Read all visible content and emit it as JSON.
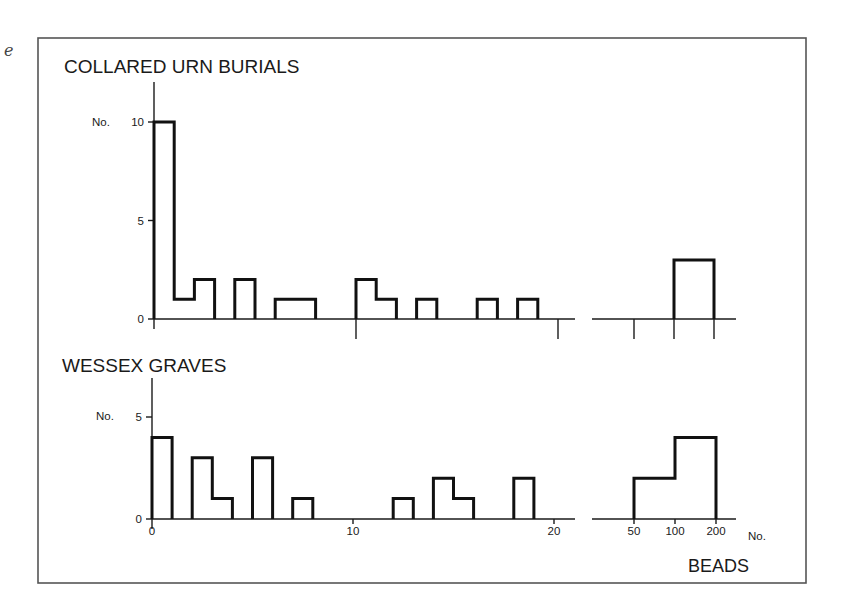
{
  "figure": {
    "margin_mark": "e",
    "beads_label": "BEADS",
    "no_label": "No."
  },
  "chart_data": [
    {
      "type": "bar",
      "title": "COLLARED URN BURIALS",
      "ylabel": "No.",
      "xlabel": "BEADS (No.)",
      "ylim": [
        0,
        10
      ],
      "yticks": [
        0,
        5,
        10
      ],
      "xticks": [
        0,
        10,
        20
      ],
      "xtick_labels_shown": false,
      "grid": false,
      "bins_unit": [
        {
          "x0": 0,
          "x1": 1,
          "count": 10
        },
        {
          "x0": 1,
          "x1": 2,
          "count": 1
        },
        {
          "x0": 2,
          "x1": 3,
          "count": 2
        },
        {
          "x0": 3,
          "x1": 4,
          "count": 0
        },
        {
          "x0": 4,
          "x1": 5,
          "count": 2
        },
        {
          "x0": 5,
          "x1": 6,
          "count": 0
        },
        {
          "x0": 6,
          "x1": 7,
          "count": 1
        },
        {
          "x0": 7,
          "x1": 8,
          "count": 1
        },
        {
          "x0": 8,
          "x1": 9,
          "count": 0
        },
        {
          "x0": 9,
          "x1": 10,
          "count": 0
        },
        {
          "x0": 10,
          "x1": 11,
          "count": 2
        },
        {
          "x0": 11,
          "x1": 12,
          "count": 1
        },
        {
          "x0": 12,
          "x1": 13,
          "count": 0
        },
        {
          "x0": 13,
          "x1": 14,
          "count": 1
        },
        {
          "x0": 14,
          "x1": 15,
          "count": 0
        },
        {
          "x0": 15,
          "x1": 16,
          "count": 0
        },
        {
          "x0": 16,
          "x1": 17,
          "count": 1
        },
        {
          "x0": 17,
          "x1": 18,
          "count": 0
        },
        {
          "x0": 18,
          "x1": 19,
          "count": 1
        }
      ],
      "bins_large": [
        {
          "range": "50-100",
          "count": 0
        },
        {
          "range": "100-200",
          "count": 3
        }
      ]
    },
    {
      "type": "bar",
      "title": "WESSEX GRAVES",
      "ylabel": "No.",
      "xlabel": "BEADS (No.)",
      "ylim": [
        0,
        5
      ],
      "yticks": [
        0,
        5
      ],
      "xticks": [
        0,
        10,
        20
      ],
      "xtick_labels": [
        "0",
        "10",
        "20"
      ],
      "large_xtick_labels": [
        "50",
        "100",
        "200"
      ],
      "grid": false,
      "bins_unit": [
        {
          "x0": 0,
          "x1": 1,
          "count": 4
        },
        {
          "x0": 1,
          "x1": 2,
          "count": 0
        },
        {
          "x0": 2,
          "x1": 3,
          "count": 3
        },
        {
          "x0": 3,
          "x1": 4,
          "count": 1
        },
        {
          "x0": 4,
          "x1": 5,
          "count": 0
        },
        {
          "x0": 5,
          "x1": 6,
          "count": 3
        },
        {
          "x0": 6,
          "x1": 7,
          "count": 0
        },
        {
          "x0": 7,
          "x1": 8,
          "count": 1
        },
        {
          "x0": 8,
          "x1": 9,
          "count": 0
        },
        {
          "x0": 9,
          "x1": 10,
          "count": 0
        },
        {
          "x0": 10,
          "x1": 11,
          "count": 0
        },
        {
          "x0": 11,
          "x1": 12,
          "count": 0
        },
        {
          "x0": 12,
          "x1": 13,
          "count": 1
        },
        {
          "x0": 13,
          "x1": 14,
          "count": 0
        },
        {
          "x0": 14,
          "x1": 15,
          "count": 2
        },
        {
          "x0": 15,
          "x1": 16,
          "count": 1
        },
        {
          "x0": 16,
          "x1": 17,
          "count": 0
        },
        {
          "x0": 17,
          "x1": 18,
          "count": 0
        },
        {
          "x0": 18,
          "x1": 19,
          "count": 2
        }
      ],
      "bins_large": [
        {
          "range": "50-100",
          "count": 2
        },
        {
          "range": "100-200",
          "count": 4
        }
      ]
    }
  ]
}
